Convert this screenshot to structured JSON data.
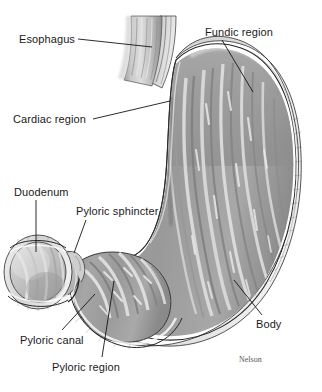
{
  "figure": {
    "credit": "Nelson",
    "caption_remnant": "",
    "background_color": "#ffffff",
    "ink_color": "#1a1a1a"
  },
  "labels": {
    "esophagus": "Esophagus",
    "cardiac_region": "Cardiac region",
    "fundic_region": "Fundic region",
    "body": "Body",
    "duodenum": "Duodenum",
    "pyloric_sphincter": "Pyloric sphincter",
    "pyloric_canal": "Pyloric canal",
    "pyloric_region": "Pyloric region"
  },
  "anatomy": {
    "type": "medical-illustration",
    "subject": "human stomach, sectioned to reveal interior mucosa and rugae",
    "view": "anterior coronal cutaway",
    "rendering": "grayscale halftone engraving",
    "parts": [
      {
        "name": "Esophagus",
        "description": "tubular inlet entering at upper left, longitudinally ridged",
        "label_anchor_x": 152,
        "label_anchor_y": 47
      },
      {
        "name": "Cardiac region",
        "description": "junction of esophagus and stomach along the lesser curvature",
        "label_anchor_x": 168,
        "label_anchor_y": 101
      },
      {
        "name": "Fundic region",
        "description": "domed upper-right chamber above the cardiac opening",
        "label_anchor_x": 253,
        "label_anchor_y": 92
      },
      {
        "name": "Body",
        "description": "large central chamber lined with vertical rugae",
        "label_anchor_x": 233,
        "label_anchor_y": 282
      },
      {
        "name": "Duodenum",
        "description": "cut cylinder of small intestine at far left, showing layered wall",
        "label_anchor_x": 36,
        "label_anchor_y": 252
      },
      {
        "name": "Pyloric sphincter",
        "description": "muscular notch between pyloric canal and duodenum",
        "label_anchor_x": 73,
        "label_anchor_y": 253
      },
      {
        "name": "Pyloric canal",
        "description": "narrow outlet channel leading to the sphincter",
        "label_anchor_x": 95,
        "label_anchor_y": 295
      },
      {
        "name": "Pyloric region",
        "description": "lower-left antrum with curved transverse rugae",
        "label_anchor_x": 113,
        "label_anchor_y": 281
      }
    ],
    "palette": {
      "mucosa_mid": "#9a9a9a",
      "mucosa_light": "#d8d8d8",
      "mucosa_dark": "#747474",
      "wall_outline": "#2a2a2a",
      "serosa_band": "#e8e8e8",
      "esophagus_light": "#cdcdcd"
    }
  },
  "leaders": [
    {
      "name": "esophagus",
      "x1": 78,
      "y1": 39,
      "x2": 152,
      "y2": 47
    },
    {
      "name": "cardiac_region",
      "x1": 93,
      "y1": 119,
      "x2": 170,
      "y2": 101
    },
    {
      "name": "fundic_region",
      "x1": 222,
      "y1": 40,
      "x2": 253,
      "y2": 92
    },
    {
      "name": "body",
      "x1": 262,
      "y1": 315,
      "x2": 234,
      "y2": 280
    },
    {
      "name": "duodenum",
      "x1": 36,
      "y1": 200,
      "x2": 36,
      "y2": 252
    },
    {
      "name": "pyloric_sphincter",
      "x1": 86,
      "y1": 220,
      "x2": 74,
      "y2": 253
    },
    {
      "name": "pyloric_canal",
      "x1": 62,
      "y1": 330,
      "x2": 95,
      "y2": 294
    },
    {
      "name": "pyloric_region",
      "x1": 102,
      "y1": 357,
      "x2": 114,
      "y2": 281
    }
  ]
}
